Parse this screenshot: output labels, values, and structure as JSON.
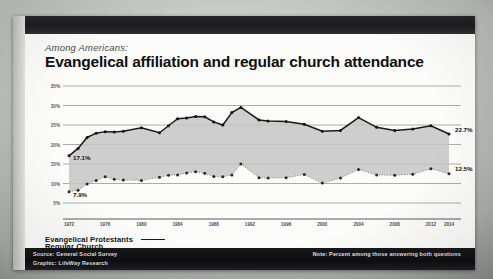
{
  "slide": {
    "kicker": "Among Americans:",
    "headline": "Evangelical affiliation and regular church attendance"
  },
  "legend": {
    "items": [
      {
        "label": "Evangelical Protestants",
        "style": "solid",
        "color": "#1a1a1a"
      },
      {
        "label": "Regular Church Attendees",
        "style": "dotted",
        "color": "#8d8d8d"
      }
    ]
  },
  "footer": {
    "source_line1": "Source: General Social Survey",
    "source_line2": "Graphic: LifeWay Research",
    "note": "Note: Percent among those answering both questions"
  },
  "chart_data": {
    "type": "line",
    "title": "Evangelical affiliation and regular church attendance",
    "subtitle": "Among Americans:",
    "xlabel": "",
    "ylabel": "",
    "ylim": [
      5,
      35
    ],
    "ytick_values": [
      35,
      30,
      25,
      20,
      15,
      10,
      5
    ],
    "ytick_labels": [
      "35%",
      "30%",
      "25%",
      "20%",
      "15%",
      "10%",
      "5%"
    ],
    "grid": true,
    "legend_position": "below-left",
    "x_tick_labels": [
      "1972",
      "1976",
      "1980",
      "1984",
      "1988",
      "1992",
      "1996",
      "2000",
      "2004",
      "2008",
      "2012",
      "2014"
    ],
    "x_tick_years": [
      1972,
      1976,
      1980,
      1984,
      1988,
      1992,
      1996,
      2000,
      2004,
      2008,
      2012,
      2014
    ],
    "x": [
      1972,
      1973,
      1974,
      1975,
      1976,
      1977,
      1978,
      1980,
      1982,
      1983,
      1984,
      1985,
      1986,
      1987,
      1988,
      1989,
      1990,
      1991,
      1993,
      1994,
      1996,
      1998,
      2000,
      2002,
      2004,
      2006,
      2008,
      2010,
      2012,
      2014
    ],
    "series": [
      {
        "name": "Evangelical Protestants",
        "style": "solid",
        "color": "#1a1a1a",
        "values": [
          17.1,
          19.0,
          21.8,
          22.9,
          23.3,
          23.2,
          23.4,
          24.3,
          23.0,
          24.8,
          26.6,
          26.8,
          27.2,
          27.1,
          25.8,
          25.0,
          28.2,
          29.5,
          26.3,
          26.0,
          25.9,
          25.2,
          23.4,
          23.6,
          26.9,
          24.4,
          23.6,
          24.0,
          24.8,
          22.7
        ],
        "first_label": "17.1%",
        "last_label": "22.7%"
      },
      {
        "name": "Regular Church Attendees",
        "style": "dotted",
        "color": "#8d8d8d",
        "values": [
          7.9,
          8.3,
          9.9,
          10.8,
          11.7,
          11.1,
          10.9,
          10.8,
          11.6,
          12.1,
          12.2,
          12.7,
          13.0,
          12.6,
          11.8,
          11.7,
          12.2,
          15.0,
          11.5,
          11.4,
          11.5,
          12.3,
          10.1,
          11.4,
          13.6,
          12.2,
          12.1,
          12.4,
          13.8,
          12.5
        ],
        "first_label": "7.9%",
        "last_label": "12.5%"
      }
    ],
    "band_fill": "#c4c6c4",
    "annotations": [
      {
        "text": "17.1%",
        "series": "Evangelical Protestants",
        "x": 1972,
        "y": 17.1
      },
      {
        "text": "7.9%",
        "series": "Regular Church Attendees",
        "x": 1972,
        "y": 7.9
      },
      {
        "text": "22.7%",
        "series": "Evangelical Protestants",
        "x": 2014,
        "y": 22.7
      },
      {
        "text": "12.5%",
        "series": "Regular Church Attendees",
        "x": 2014,
        "y": 12.5
      }
    ]
  }
}
